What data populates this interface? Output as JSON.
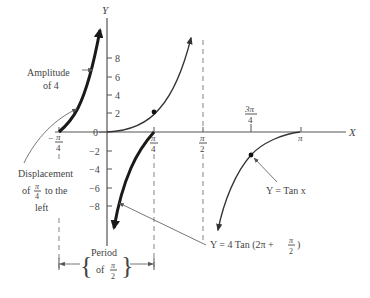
{
  "diagram": {
    "axes": {
      "x_label": "X",
      "y_label": "Y",
      "origin_label": "0",
      "y_ticks": [
        {
          "value": "8",
          "y": 58
        },
        {
          "value": "6",
          "y": 77
        },
        {
          "value": "4",
          "y": 95
        },
        {
          "value": "2",
          "y": 113
        },
        {
          "value": "−2",
          "y": 151
        },
        {
          "value": "−4",
          "y": 169
        },
        {
          "value": "−6",
          "y": 188
        },
        {
          "value": "−8",
          "y": 206
        }
      ],
      "x_ticks": {
        "neg_pi_4": {
          "sign": "−",
          "num": "π",
          "den": "4"
        },
        "pi_4": {
          "num": "π",
          "den": "4"
        },
        "pi_2": {
          "num": "π",
          "den": "2"
        },
        "three_pi_4": {
          "num": "3π",
          "den": "4"
        },
        "pi": {
          "label": "π"
        }
      }
    },
    "annotations": {
      "amplitude": {
        "line1": "Amplitude",
        "line2": "of 4"
      },
      "displacement": {
        "line1": "Displacement",
        "of": "of",
        "num": "π",
        "den": "4",
        "to_the": "to the",
        "line3": "left"
      },
      "period": {
        "line1": "Period",
        "of": "of",
        "num": "π",
        "den": "2"
      },
      "tan_label": {
        "text": "Y = Tan x"
      },
      "transformed_label": {
        "prefix": "Y = 4 Tan (2π + ",
        "num": "π",
        "den": "2",
        "suffix": ")"
      }
    },
    "curves": [
      {
        "name": "Y = Tan x",
        "style": "thin"
      },
      {
        "name": "Y = 4 Tan (2π + π/2)",
        "style": "thick"
      }
    ]
  }
}
